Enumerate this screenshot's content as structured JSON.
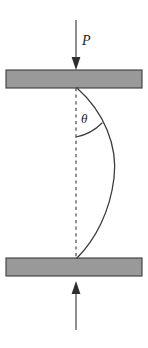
{
  "figure": {
    "name": "buckled-column-diagram",
    "width": 148,
    "height": 348,
    "background_color": "#ffffff"
  },
  "labels": {
    "load": "P",
    "angle": "θ"
  },
  "colors": {
    "plate_fill": "#999999",
    "plate_stroke": "#3b3b3b",
    "curve_stroke": "#3b3b3b",
    "centerline_stroke": "#4a4a4a",
    "arrow_fill": "#2e2e2e",
    "label_fill": "#1c1c1c"
  },
  "elements": {
    "top_plate": {
      "name": "top-plate",
      "x": 6,
      "y": 70,
      "width": 136,
      "height": 18
    },
    "bottom_plate": {
      "name": "bottom-plate",
      "x": 6,
      "y": 258,
      "width": 136,
      "height": 18
    },
    "top_load_arrow": {
      "name": "top-load-arrow",
      "direction": "down",
      "x": 76,
      "y_start": 20,
      "y_tip": 70
    },
    "bottom_load_arrow": {
      "name": "bottom-load-arrow",
      "direction": "up",
      "x": 76,
      "y_start": 330,
      "y_tip": 281
    },
    "centerline": {
      "name": "centerline",
      "x": 76,
      "y_start": 88,
      "y_end": 258,
      "style": "dashed"
    },
    "column_curve": {
      "name": "buckled-column-curve",
      "top_anchor_x": 77,
      "top_anchor_y": 88,
      "bottom_anchor_x": 77,
      "bottom_anchor_y": 258,
      "max_deflection_x": 114,
      "max_deflection_y": 176
    },
    "angle_arc": {
      "name": "angle-arc",
      "vertex_x": 76,
      "vertex_y": 88,
      "radius": 49
    }
  },
  "label_positions": {
    "load": {
      "x": 82,
      "y": 45
    },
    "angle": {
      "x": 81,
      "y": 123
    }
  }
}
